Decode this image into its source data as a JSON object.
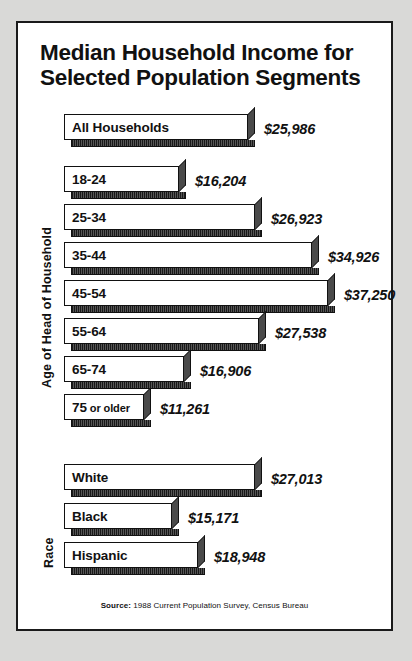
{
  "chart_data": {
    "type": "bar",
    "title": "Median Household Income for Selected Population Segments",
    "title_lines": [
      "Median Household Income for",
      "Selected Population Segments"
    ],
    "xlabel": "",
    "ylabel": "",
    "orientation": "horizontal",
    "grid": false,
    "legend": "none",
    "value_prefix": "$",
    "axis_groups": [
      {
        "label": "Age of Head of Household"
      },
      {
        "label": "Race"
      }
    ],
    "source_lead": "Source:",
    "source_text": " 1988 Current Population Survey, Census Bureau",
    "categories": [
      "All Households",
      "18-24",
      "25-34",
      "35-44",
      "45-54",
      "55-64",
      "65-74",
      "75 or older",
      "White",
      "Black",
      "Hispanic"
    ],
    "values": [
      25986,
      16204,
      26923,
      34926,
      37250,
      27538,
      16906,
      11261,
      27013,
      15171,
      18948
    ],
    "value_labels": [
      "$25,986",
      "$16,204",
      "$26,923",
      "$34,926",
      "$37,250",
      "$27,538",
      "$16,906",
      "$11,261",
      "$27,013",
      "$15,171",
      "$18,948"
    ],
    "bars": [
      {
        "label": "All Households",
        "value": 25986,
        "value_label": "$25,986",
        "group": ""
      },
      {
        "label": "18-24",
        "value": 16204,
        "value_label": "$16,204",
        "group": "Age of Head of Household"
      },
      {
        "label": "25-34",
        "value": 26923,
        "value_label": "$26,923",
        "group": "Age of Head of Household"
      },
      {
        "label": "35-44",
        "value": 34926,
        "value_label": "$34,926",
        "group": "Age of Head of Household"
      },
      {
        "label": "45-54",
        "value": 37250,
        "value_label": "$37,250",
        "group": "Age of Head of Household"
      },
      {
        "label": "55-64",
        "value": 27538,
        "value_label": "$27,538",
        "group": "Age of Head of Household"
      },
      {
        "label": "65-74",
        "value": 16906,
        "value_label": "$16,906",
        "group": "Age of Head of Household"
      },
      {
        "label": "75 or older",
        "label_main": "75",
        "label_small": "or older",
        "value": 11261,
        "value_label": "$11,261",
        "group": "Age of Head of Household"
      },
      {
        "label": "White",
        "value": 27013,
        "value_label": "$27,013",
        "group": "Race"
      },
      {
        "label": "Black",
        "value": 15171,
        "value_label": "$15,171",
        "group": "Race"
      },
      {
        "label": "Hispanic",
        "value": 18948,
        "value_label": "$18,948",
        "group": "Race"
      }
    ],
    "colors": {
      "bar_fill": "#ffffff",
      "bar_stroke": "#111111",
      "shadow": "#4a4a4a",
      "text": "#111111",
      "panel": "#ffffff",
      "page": "#d9d9d7"
    }
  }
}
